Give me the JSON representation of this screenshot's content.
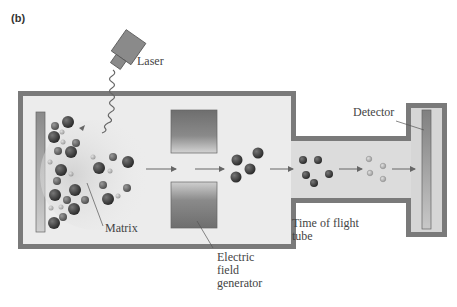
{
  "panel_label": "(b)",
  "labels": {
    "laser": "Laser",
    "matrix": "Matrix",
    "electric_field_line1": "Electric",
    "electric_field_line2": "field",
    "electric_field_line3": "generator",
    "time_of_flight_line1": "Time of flight",
    "time_of_flight_line2": "tube",
    "detector": "Detector"
  },
  "colors": {
    "chamber_wall": "#7a7a7a",
    "chamber_fill": "#ececec",
    "plate_dark": "#6a6a6a",
    "plate_light": "#d0d0d0",
    "ion_dark": "#3a3a3a",
    "ion_light": "#b8b8b8",
    "arrow": "#666666"
  }
}
